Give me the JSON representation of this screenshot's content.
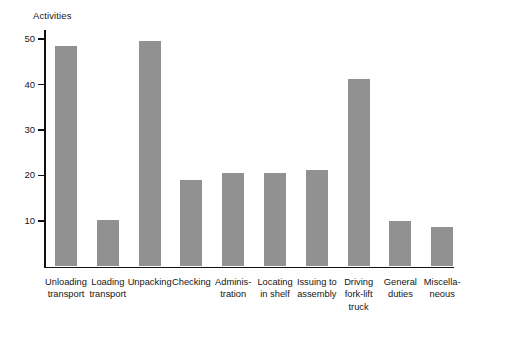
{
  "chart_data": {
    "type": "bar",
    "title": "",
    "ylabel": "Activities",
    "xlabel": "",
    "ylim": [
      0,
      52
    ],
    "yticks": [
      10,
      20,
      30,
      40,
      50
    ],
    "grid": false,
    "legend": null,
    "bar_color": "#919191",
    "axis_color": "#121212",
    "categories": [
      "Unloading transport",
      "Loading transport",
      "Unpacking",
      "Checking",
      "Administration",
      "Locating in shelf",
      "Issuing to assembly",
      "Driving fork-lift truck",
      "General duties",
      "Miscellaneous"
    ],
    "category_lines": [
      [
        "Unloading",
        "transport"
      ],
      [
        "Loading",
        "transport"
      ],
      [
        "Unpacking"
      ],
      [
        "Checking"
      ],
      [
        "Adminis-",
        "tration"
      ],
      [
        "Locating",
        "in shelf"
      ],
      [
        "Issuing to",
        "assembly"
      ],
      [
        "Driving",
        "fork-lift",
        "truck"
      ],
      [
        "General",
        "duties"
      ],
      [
        "Miscella-",
        "neous"
      ]
    ],
    "values": [
      48.4,
      10.2,
      49.5,
      19.0,
      20.6,
      20.6,
      21.3,
      41.3,
      9.9,
      8.7
    ]
  }
}
